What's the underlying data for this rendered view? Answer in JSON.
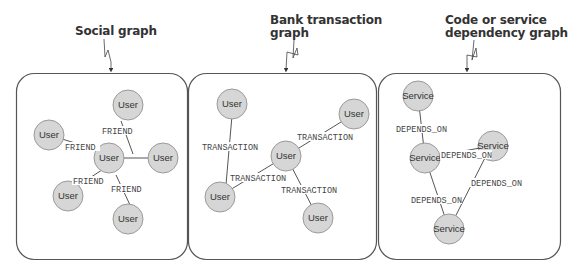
{
  "colors": {
    "node_fill": "#d6d6d6",
    "node_stroke": "#9a9a9a",
    "edge": "#555555",
    "panel_stroke": "#555555",
    "title": "#333333"
  },
  "panels": [
    {
      "title": "Social graph",
      "node_label": "User",
      "edge_label": "FRIEND"
    },
    {
      "title_line1": "Bank transaction",
      "title_line2": "graph",
      "node_label": "User",
      "edge_label": "TRANSACTION"
    },
    {
      "title_line1": "Code or service",
      "title_line2": "dependency graph",
      "node_label": "Service",
      "edge_label": "DEPENDS_ON"
    }
  ],
  "social": {
    "nodes": [
      "User",
      "User",
      "User",
      "User",
      "User",
      "User"
    ],
    "edges": [
      "FRIEND",
      "FRIEND",
      "FRIEND",
      "FRIEND"
    ]
  },
  "bank": {
    "nodes": [
      "User",
      "User",
      "User",
      "User",
      "User"
    ],
    "edges": [
      "TRANSACTION",
      "TRANSACTION",
      "TRANSACTION",
      "TRANSACTION"
    ]
  },
  "dependency": {
    "nodes": [
      "Service",
      "Service",
      "Service",
      "Service"
    ],
    "edges": [
      "DEPENDS_ON",
      "DEPENDS_ON",
      "DEPENDS_ON",
      "DEPENDS_ON"
    ]
  }
}
